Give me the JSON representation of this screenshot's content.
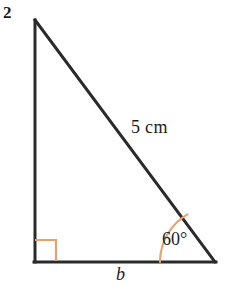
{
  "figure": {
    "problem_number": "2",
    "background_color": "#ffffff",
    "stroke_color": "#2a2a2a",
    "accent_color": "#e8a070",
    "labels": {
      "hypotenuse": "5 cm",
      "angle": "60°",
      "base": "b"
    },
    "geometry": {
      "apex": {
        "x": 35,
        "y": 20
      },
      "bottom_left": {
        "x": 35,
        "y": 262
      },
      "bottom_right": {
        "x": 215,
        "y": 262
      },
      "right_angle_marker_size": 21,
      "angle_arc_radius": 55,
      "angle_degrees": 60
    }
  }
}
